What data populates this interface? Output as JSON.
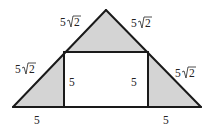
{
  "figure": {
    "shade_color": "#d4d4d4",
    "line_color": "#1a1a1a",
    "labels": {
      "top_left_slant": {
        "coef": "5",
        "radicand": "2"
      },
      "top_right_slant": {
        "coef": "5",
        "radicand": "2"
      },
      "bottom_left_slant": {
        "coef": "5",
        "radicand": "2"
      },
      "bottom_right_slant": {
        "coef": "5",
        "radicand": "2"
      },
      "rect_left_height": "5",
      "rect_right_height": "5",
      "base_left_segment": "5",
      "base_right_segment": "5"
    }
  }
}
